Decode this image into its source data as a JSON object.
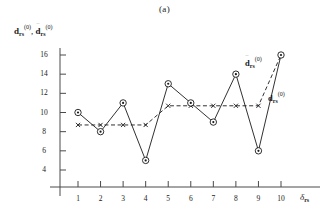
{
  "figure": {
    "title": "(a)",
    "y_axis_label_plain": "d_rs^(0), d~_rs^(0)",
    "x_axis_label_plain": "delta_rs",
    "symbol_base": "d",
    "symbol_sub": "rs",
    "symbol_sup": "(0)",
    "delta_glyph": "δ",
    "annotation_dtilde": "d~_rs^(0)",
    "annotation_d": "d_rs^(0)"
  },
  "chart_data": {
    "type": "line",
    "title": "(a)",
    "xlabel": "δ_rs",
    "ylabel": "d_rs^(0), d̃_rs^(0)",
    "x": [
      1,
      2,
      3,
      4,
      5,
      6,
      7,
      8,
      9,
      10
    ],
    "xticklabels": [
      "1",
      "2",
      "3",
      "4",
      "5",
      "6",
      "7",
      "8",
      "9",
      "10"
    ],
    "yticks": [
      4,
      6,
      8,
      10,
      12,
      14,
      16
    ],
    "yticklabels": [
      "4",
      "6",
      "8",
      "10",
      "12",
      "14",
      "16"
    ],
    "xlim": [
      0.5,
      10.6
    ],
    "ylim": [
      3.0,
      17.0
    ],
    "grid": false,
    "legend": "none",
    "series": [
      {
        "name": "d_rs^(0)",
        "style": "solid",
        "marker": "circle-dot",
        "color": "#1a1a1a",
        "values": [
          10,
          8,
          11,
          5,
          13,
          11,
          9,
          14,
          6,
          16
        ]
      },
      {
        "name": "d̃_rs^(0)",
        "style": "dashed",
        "marker": "cross",
        "color": "#1a1a1a",
        "values": [
          8.7,
          8.7,
          8.7,
          8.7,
          10.7,
          10.7,
          10.7,
          10.7,
          10.7,
          16
        ]
      }
    ],
    "annotations": [
      {
        "text": "d̃_rs^(0)",
        "x": 9.3,
        "y": 14.2
      },
      {
        "text": "d_rs^(0)",
        "x": 10.0,
        "y": 11.6
      }
    ]
  }
}
